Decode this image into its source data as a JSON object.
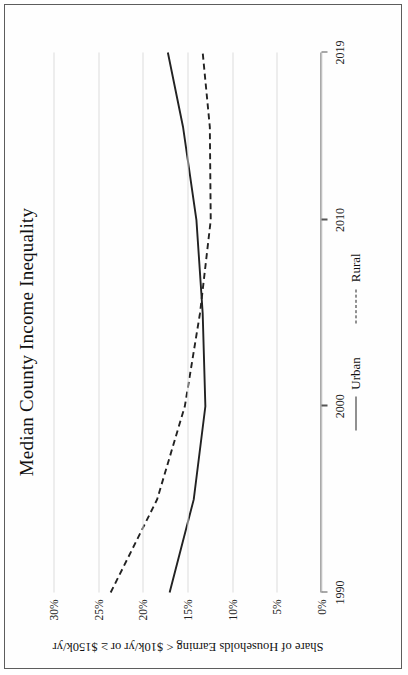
{
  "figure": {
    "title": "Median County Income Inequality",
    "ylabel": "Share of Households Earning < $10k/yr or ≥ $150k/yr",
    "legend": [
      {
        "label": "Urban",
        "style": "solid"
      },
      {
        "label": "Rural",
        "style": "dashed"
      }
    ]
  },
  "axes": {
    "x_ticks": [
      "1990",
      "2000",
      "2010",
      "2019"
    ],
    "y_ticks": [
      "0%",
      "5%",
      "10%",
      "15%",
      "20%",
      "25%",
      "30%"
    ]
  },
  "chart_data": {
    "type": "line",
    "title": "Median County Income Inequality",
    "xlabel": "",
    "ylabel": "Share of Households Earning < $10k/yr or ≥ $150k/yr",
    "xlim": [
      1990,
      2019
    ],
    "ylim": [
      0,
      30
    ],
    "y_tick_values": [
      0,
      5,
      10,
      15,
      20,
      25,
      30
    ],
    "x_tick_values": [
      1990,
      2000,
      2010,
      2019
    ],
    "y_tick_labels": [
      "0%",
      "5%",
      "10%",
      "15%",
      "20%",
      "25%",
      "30%"
    ],
    "x_tick_labels": [
      "1990",
      "2000",
      "2010",
      "2019"
    ],
    "grid": "y-gridlines-only",
    "legend_position": "below-plot-center",
    "orientation": "figure rotated 90 degrees counter-clockwise on page",
    "x": [
      1990,
      1995,
      2000,
      2005,
      2010,
      2015,
      2019
    ],
    "series": [
      {
        "name": "Urban",
        "style": "solid",
        "color": "#222222",
        "values": [
          17.0,
          14.3,
          13.0,
          13.3,
          14.0,
          15.5,
          17.2
        ]
      },
      {
        "name": "Rural",
        "style": "dashed",
        "color": "#222222",
        "values": [
          23.6,
          18.4,
          15.3,
          13.6,
          12.4,
          12.5,
          13.3
        ]
      }
    ]
  }
}
